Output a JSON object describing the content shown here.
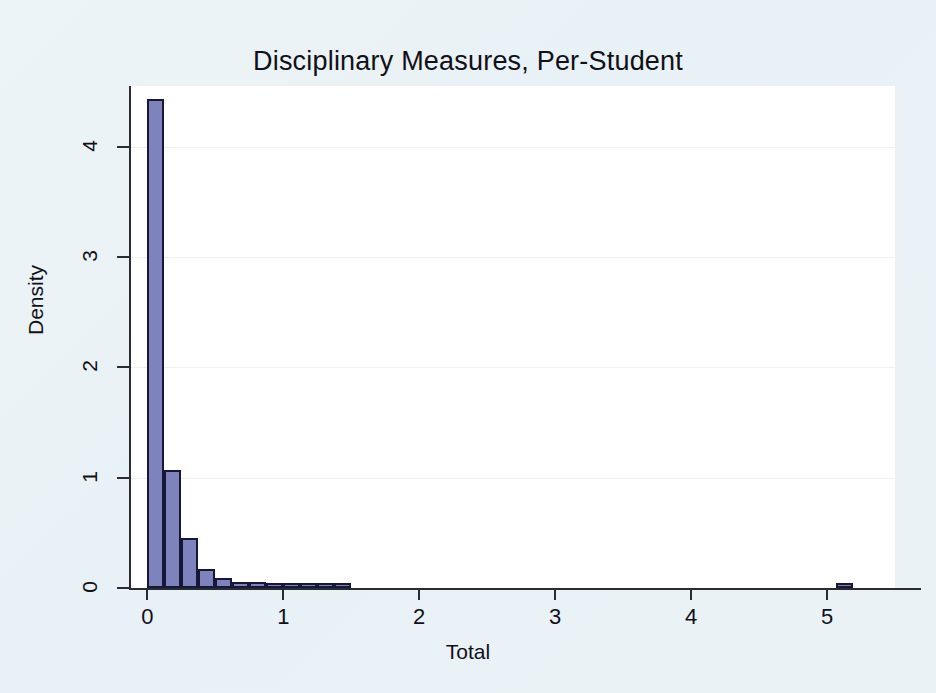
{
  "figure": {
    "background_color": "#eaf2f6",
    "plot_background_color": "#ffffff",
    "bar_fill_color": "#7f83bb",
    "bar_edge_color": "#17173a",
    "axis_color": "#2b2b33"
  },
  "chart_data": {
    "type": "bar",
    "subtype": "histogram",
    "title": "Disciplinary Measures, Per-Student",
    "subtitle": "",
    "xlabel": "Total",
    "ylabel": "Density",
    "xlim": [
      -0.12,
      5.5
    ],
    "ylim": [
      0,
      4.55
    ],
    "xticks": [
      0,
      1,
      2,
      3,
      4,
      5
    ],
    "xtick_labels": [
      "0",
      "1",
      "2",
      "3",
      "4",
      "5"
    ],
    "yticks": [
      0,
      1,
      2,
      3,
      4
    ],
    "ytick_labels": [
      "0",
      "1",
      "2",
      "3",
      "4"
    ],
    "grid": "faint-horizontal",
    "legend": "none",
    "bin_width": 0.125,
    "bin_starts": [
      0.0,
      0.125,
      0.25,
      0.375,
      0.5,
      0.625,
      0.75,
      0.875,
      1.0,
      1.125,
      1.25,
      1.375,
      5.0625
    ],
    "categories": [
      "0.00-0.125",
      "0.125-0.25",
      "0.25-0.375",
      "0.375-0.50",
      "0.50-0.625",
      "0.625-0.75",
      "0.75-0.875",
      "0.875-1.00",
      "1.00-1.125",
      "1.125-1.25",
      "1.25-1.375",
      "1.375-1.50",
      "5.06-5.19"
    ],
    "values": [
      4.43,
      1.07,
      0.45,
      0.17,
      0.09,
      0.055,
      0.05,
      0.045,
      0.04,
      0.03,
      0.025,
      0.015,
      0.03
    ]
  },
  "bars": [
    {
      "label": "bin-0.000",
      "x0": 0.0,
      "x1": 0.125,
      "density": 4.43
    },
    {
      "label": "bin-0.125",
      "x0": 0.125,
      "x1": 0.25,
      "density": 1.07
    },
    {
      "label": "bin-0.250",
      "x0": 0.25,
      "x1": 0.375,
      "density": 0.45
    },
    {
      "label": "bin-0.375",
      "x0": 0.375,
      "x1": 0.5,
      "density": 0.17
    },
    {
      "label": "bin-0.500",
      "x0": 0.5,
      "x1": 0.625,
      "density": 0.09
    },
    {
      "label": "bin-0.625",
      "x0": 0.625,
      "x1": 0.75,
      "density": 0.055
    },
    {
      "label": "bin-0.750",
      "x0": 0.75,
      "x1": 0.875,
      "density": 0.05
    },
    {
      "label": "bin-0.875",
      "x0": 0.875,
      "x1": 1.0,
      "density": 0.045
    },
    {
      "label": "bin-1.000",
      "x0": 1.0,
      "x1": 1.125,
      "density": 0.04
    },
    {
      "label": "bin-1.125",
      "x0": 1.125,
      "x1": 1.25,
      "density": 0.03
    },
    {
      "label": "bin-1.250",
      "x0": 1.25,
      "x1": 1.375,
      "density": 0.025
    },
    {
      "label": "bin-1.375",
      "x0": 1.375,
      "x1": 1.5,
      "density": 0.015
    },
    {
      "label": "bin-5.062",
      "x0": 5.0625,
      "x1": 5.1875,
      "density": 0.03
    }
  ]
}
